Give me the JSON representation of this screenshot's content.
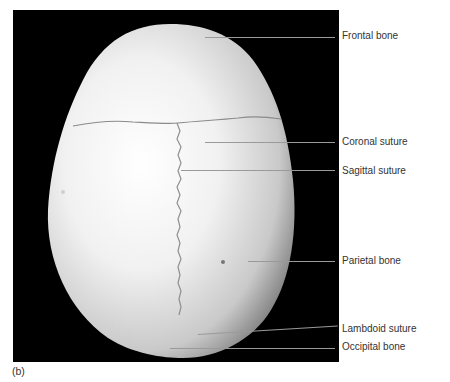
{
  "figure": {
    "panel_tag": "(b)",
    "labels": [
      {
        "id": "frontal-bone",
        "text": "Frontal bone"
      },
      {
        "id": "coronal-suture",
        "text": "Coronal suture"
      },
      {
        "id": "sagittal-suture",
        "text": "Sagittal suture"
      },
      {
        "id": "parietal-bone",
        "text": "Parietal bone"
      },
      {
        "id": "lambdoid-suture",
        "text": "Lambdoid suture"
      },
      {
        "id": "occipital-bone",
        "text": "Occipital bone"
      }
    ]
  },
  "colors": {
    "background": "#000000",
    "bone": "#e9e9e9",
    "leader": "#9a9a9a",
    "text": "#333333"
  }
}
